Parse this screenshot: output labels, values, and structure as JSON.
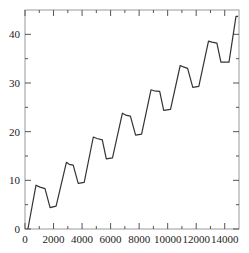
{
  "chart_data": {
    "type": "line",
    "title": "",
    "xlabel": "",
    "ylabel": "",
    "xlim": [
      0,
      15000
    ],
    "ylim": [
      0,
      45
    ],
    "grid": false,
    "legend": null,
    "x_ticks": [
      0,
      2000,
      4000,
      6000,
      8000,
      10000,
      12000,
      14000
    ],
    "x_tick_labels": [
      "0",
      "2000",
      "4000",
      "6000",
      "8000",
      "10000",
      "12000",
      "14000"
    ],
    "x_minor_ticks": [
      1000,
      3000,
      5000,
      7000,
      9000,
      11000,
      13000
    ],
    "y_ticks": [
      0,
      10,
      20,
      30,
      40
    ],
    "y_tick_labels": [
      "0",
      "10",
      "20",
      "30",
      "40"
    ],
    "y_minor_ticks": [
      5,
      15,
      25,
      35
    ],
    "series": [
      {
        "name": "series",
        "color": "#333333",
        "x": [
          200,
          770,
          1050,
          1400,
          1760,
          2180,
          2900,
          3100,
          3380,
          3730,
          4150,
          4790,
          5050,
          5420,
          5700,
          6130,
          6830,
          7050,
          7390,
          7750,
          8170,
          8830,
          9050,
          9440,
          9720,
          10200,
          10880,
          11100,
          11400,
          11760,
          12180,
          12860,
          13100,
          13450,
          13730,
          14300,
          14790,
          14930
        ],
        "y": [
          0,
          9.0,
          8.6,
          8.3,
          4.4,
          4.7,
          13.7,
          13.3,
          13.1,
          9.4,
          9.6,
          18.9,
          18.6,
          18.3,
          14.4,
          14.6,
          23.8,
          23.4,
          23.2,
          19.3,
          19.5,
          28.6,
          28.4,
          28.3,
          24.4,
          24.6,
          33.6,
          33.3,
          33.0,
          29.1,
          29.3,
          38.6,
          38.4,
          38.2,
          34.3,
          34.3,
          43.7,
          43.7
        ]
      }
    ]
  }
}
